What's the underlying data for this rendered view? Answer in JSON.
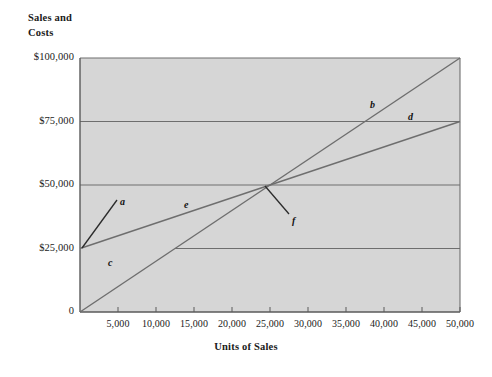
{
  "chart_data": {
    "type": "line",
    "title": "",
    "subtitle": "",
    "xlabel": "Units of Sales",
    "ylabel": "Sales and\nCosts",
    "xlim": [
      0,
      50000
    ],
    "ylim": [
      0,
      100000
    ],
    "grid": true,
    "legend_position": "none",
    "background_color": "#d6d6d6",
    "line_color": "#6e6e6e",
    "pointer_color": "#2b2b2b",
    "xticks": [
      {
        "value": 5000,
        "label": "5,000"
      },
      {
        "value": 10000,
        "label": "10,000"
      },
      {
        "value": 15000,
        "label": "15,000"
      },
      {
        "value": 20000,
        "label": "20,000"
      },
      {
        "value": 25000,
        "label": "25,000"
      },
      {
        "value": 30000,
        "label": "30,000"
      },
      {
        "value": 35000,
        "label": "35,000"
      },
      {
        "value": 40000,
        "label": "40,000"
      },
      {
        "value": 45000,
        "label": "45,000"
      },
      {
        "value": 50000,
        "label": "50,000"
      }
    ],
    "yticks": [
      {
        "value": 0,
        "label": "0"
      },
      {
        "value": 25000,
        "label": "$25,000"
      },
      {
        "value": 50000,
        "label": "$50,000"
      },
      {
        "value": 75000,
        "label": "$75,000"
      },
      {
        "value": 100000,
        "label": "$100,000"
      }
    ],
    "gridlines": [
      {
        "y": 100000,
        "x_start": 0,
        "x_end": 50000
      },
      {
        "y": 75000,
        "x_start": 0,
        "x_end": 50000
      },
      {
        "y": 50000,
        "x_start": 0,
        "x_end": 50000
      },
      {
        "y": 25000,
        "x_start": 12500,
        "x_end": 50000
      }
    ],
    "series": [
      {
        "name": "sales-line",
        "label": "b",
        "points": [
          [
            0,
            0
          ],
          [
            50000,
            100000
          ]
        ]
      },
      {
        "name": "total-cost-line",
        "label": "d",
        "points": [
          [
            0,
            25000
          ],
          [
            50000,
            75000
          ]
        ]
      }
    ],
    "break_even": {
      "x": 25000,
      "y": 50000,
      "label": "f"
    },
    "annotations": [
      {
        "id": "a",
        "label": "a",
        "text_x": 120,
        "text_y": 196,
        "pointer_from": [
          82,
          248
        ],
        "pointer_to": [
          117,
          200
        ]
      },
      {
        "id": "b",
        "label": "b",
        "text_x": 370,
        "text_y": 99,
        "pointer_from": null,
        "pointer_to": null
      },
      {
        "id": "c",
        "label": "c",
        "text_x": 108,
        "text_y": 257,
        "pointer_from": null,
        "pointer_to": null
      },
      {
        "id": "d",
        "label": "d",
        "text_x": 408,
        "text_y": 111,
        "pointer_from": null,
        "pointer_to": null
      },
      {
        "id": "e",
        "label": "e",
        "text_x": 184,
        "text_y": 199,
        "pointer_from": null,
        "pointer_to": null
      },
      {
        "id": "f",
        "label": "f",
        "text_x": 292,
        "text_y": 215,
        "pointer_from": [
          265,
          186
        ],
        "pointer_to": [
          289,
          214
        ]
      }
    ]
  }
}
